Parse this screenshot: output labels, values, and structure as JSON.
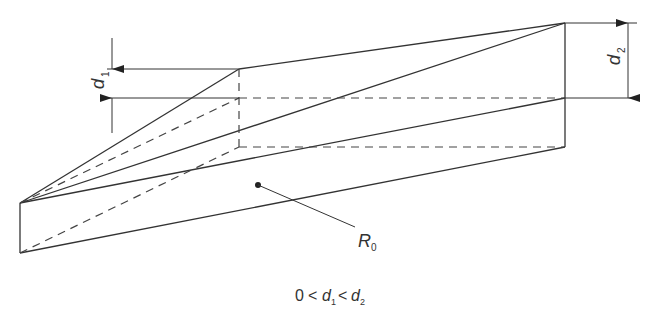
{
  "diagram": {
    "labels": {
      "d1": {
        "base": "d",
        "sub": "1"
      },
      "d2": {
        "base": "d",
        "sub": "2"
      },
      "region": {
        "base": "R",
        "sub": "0"
      }
    },
    "caption": {
      "zero": "0",
      "lt1": "<",
      "d1_base": "d",
      "d1_sub": "1",
      "lt2": "<",
      "d2_base": "d",
      "d2_sub": "2"
    },
    "colors": {
      "line": "#333333",
      "background": "#ffffff"
    }
  }
}
